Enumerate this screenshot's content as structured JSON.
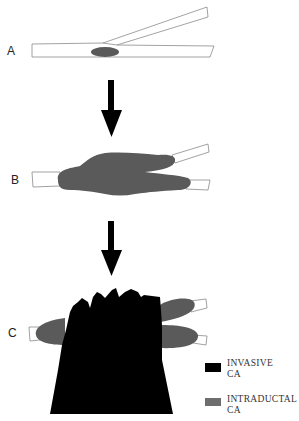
{
  "panels": [
    {
      "id": "A",
      "label": "A"
    },
    {
      "id": "B",
      "label": "B"
    },
    {
      "id": "C",
      "label": "C"
    }
  ],
  "legend": {
    "items": [
      {
        "label_line1": "INVASIVE",
        "label_line2": "CA",
        "color": "#000000"
      },
      {
        "label_line1": "INTRADUCTAL",
        "label_line2": "CA",
        "color": "#6e6e6e"
      }
    ]
  },
  "colors": {
    "duct_stroke": "#8a8a8a",
    "intraductal": "#5a5a5a",
    "invasive": "#000000",
    "arrow": "#000000"
  }
}
